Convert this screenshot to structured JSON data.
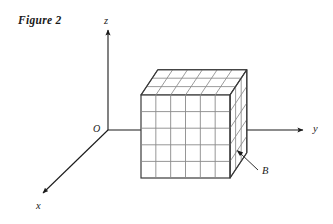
{
  "figure": {
    "caption": "Figure 2"
  },
  "axes": {
    "origin_label": "O",
    "x_label": "x",
    "y_label": "y",
    "z_label": "z",
    "stroke_color": "#1a1a1a"
  },
  "solid": {
    "callout_label": "B",
    "grid_columns": 6,
    "grid_rows": 5,
    "grid_depth": 3,
    "edge_color": "#3a3a3a",
    "grid_color": "#888888",
    "face_color": "#ffffff"
  }
}
